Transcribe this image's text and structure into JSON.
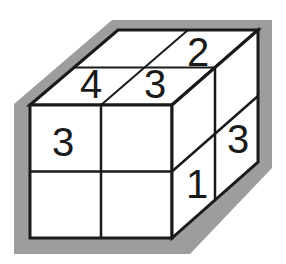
{
  "figure": {
    "colors": {
      "background": "#ffffff",
      "face_fill": "#ffffff",
      "outline": "#1a1a1a",
      "grid_line": "#1a1a1a",
      "shadow_band": "#9d9d9d",
      "digit": "#1a1a1a"
    },
    "geometry": {
      "front_top_left": [
        30,
        105
      ],
      "front_top_right": [
        172,
        105
      ],
      "front_bottom_left": [
        30,
        238
      ],
      "front_bottom_right": [
        172,
        238
      ],
      "back_top_left": [
        118,
        30
      ],
      "back_top_right": [
        258,
        30
      ],
      "back_bottom_right": [
        258,
        162
      ],
      "shadow_band_width": 16
    },
    "faces": [
      {
        "name": "top",
        "label": "Top face",
        "rows": 2,
        "cols": 2,
        "cells": [
          {
            "id": "top-back-left",
            "row": 0,
            "col": 0,
            "value": ""
          },
          {
            "id": "top-back-right",
            "row": 0,
            "col": 1,
            "value": "2"
          },
          {
            "id": "top-front-left",
            "row": 1,
            "col": 0,
            "value": "4"
          },
          {
            "id": "top-front-right",
            "row": 1,
            "col": 1,
            "value": "3"
          }
        ]
      },
      {
        "name": "front",
        "label": "Front face",
        "rows": 2,
        "cols": 2,
        "cells": [
          {
            "id": "front-top-left",
            "row": 0,
            "col": 0,
            "value": "3"
          },
          {
            "id": "front-top-right",
            "row": 0,
            "col": 1,
            "value": ""
          },
          {
            "id": "front-bottom-left",
            "row": 1,
            "col": 0,
            "value": ""
          },
          {
            "id": "front-bottom-right",
            "row": 1,
            "col": 1,
            "value": ""
          }
        ]
      },
      {
        "name": "right",
        "label": "Right face",
        "rows": 2,
        "cols": 2,
        "cells": [
          {
            "id": "right-front-top",
            "row": 0,
            "col": 0,
            "value": ""
          },
          {
            "id": "right-back-top",
            "row": 0,
            "col": 1,
            "value": "3"
          },
          {
            "id": "right-front-bottom",
            "row": 1,
            "col": 0,
            "value": "1"
          },
          {
            "id": "right-back-bottom",
            "row": 1,
            "col": 1,
            "value": ""
          }
        ]
      }
    ],
    "digits": [
      {
        "id": "digit-top-2",
        "value": "2",
        "x": 198,
        "y": 55,
        "size": 40
      },
      {
        "id": "digit-top-4",
        "value": "4",
        "x": 91,
        "y": 87,
        "size": 40
      },
      {
        "id": "digit-top-3",
        "value": "3",
        "x": 155,
        "y": 87,
        "size": 40
      },
      {
        "id": "digit-front-3",
        "value": "3",
        "x": 63,
        "y": 145,
        "size": 44
      },
      {
        "id": "digit-right-3",
        "value": "3",
        "x": 238,
        "y": 142,
        "size": 44
      },
      {
        "id": "digit-right-1",
        "value": "1",
        "x": 197,
        "y": 187,
        "size": 42
      }
    ]
  }
}
